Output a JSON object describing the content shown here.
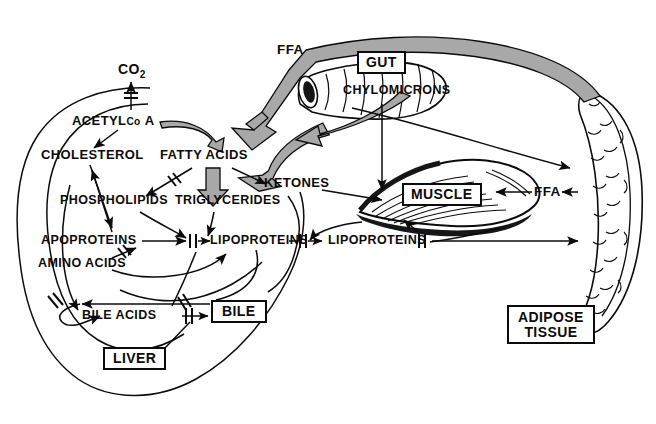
{
  "diagram": {
    "type": "biochemical-pathway-diagram",
    "ink_color": "#0b0b0b",
    "background_color": "#ffffff",
    "shaded_arrow_fill": "#a8a8a8",
    "organs": {
      "liver": {
        "label": "LIVER",
        "boxed": true
      },
      "gut": {
        "label": "GUT",
        "boxed": true
      },
      "muscle": {
        "label": "MUSCLE",
        "boxed": true
      },
      "adipose": {
        "label": "ADIPOSE\nTISSUE",
        "line1": "ADIPOSE",
        "line2": "TISSUE",
        "boxed": true
      },
      "bile": {
        "label": "BILE",
        "boxed": true
      }
    },
    "metabolites": {
      "co2": {
        "text": "CO",
        "subscript": "2"
      },
      "acetyl_coa_part1": "ACETYL",
      "acetyl_coa_part2": "Co",
      "acetyl_coa_part3": "A",
      "cholesterol": "CHOLESTEROL",
      "fatty_acids": "FATTY ACIDS",
      "phospholipids": "PHOSPHOLIPIDS",
      "triglycerides": "TRIGLYCERIDES",
      "ketones": "KETONES",
      "apoproteins": "APOPROTEINS",
      "amino_acids": "AMINO ACIDS",
      "lipoproteins_liver": "LIPOPROTEINS",
      "lipoproteins_plasma": "LIPOPROTEINS",
      "bile_acids": "BILE ACIDS",
      "chylomicrons": "CHYLOMICRONS",
      "ffa_top": "FFA",
      "ffa_muscle": "FFA"
    }
  }
}
